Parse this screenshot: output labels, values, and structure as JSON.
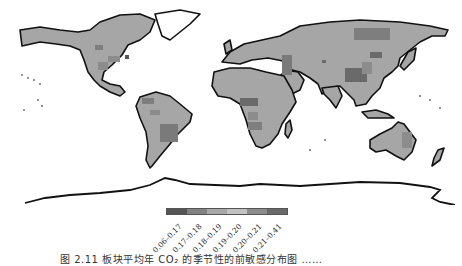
{
  "figure": {
    "caption": "图 2.11  板块平均年 CO₂ 的季节性的前敏感分布图 ……"
  },
  "map": {
    "projection": "equirectangular world",
    "land_base_color": "#a6a6a6",
    "coastline_color": "#111111",
    "ocean_color": "#ffffff"
  },
  "legend": {
    "bins": [
      {
        "label": "0.06–0.17",
        "color": "#555555"
      },
      {
        "label": "0.17–0.18",
        "color": "#828282"
      },
      {
        "label": "0.18–0.19",
        "color": "#a8a8a8"
      },
      {
        "label": "0.19–0.20",
        "color": "#c2c2c2"
      },
      {
        "label": "0.20–0.21",
        "color": "#8c8c8c"
      },
      {
        "label": "0.21–0.41",
        "color": "#6a6a6a"
      }
    ]
  }
}
